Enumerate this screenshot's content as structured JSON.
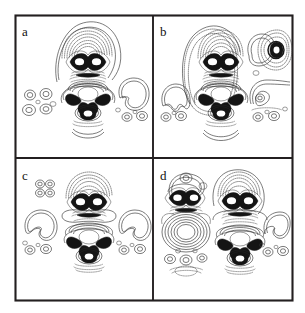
{
  "figure": {
    "name": "molecular-orbital-contour-figure",
    "background_color": "#ffffff",
    "border_color": "#231f20",
    "contour_solid_color": "#2a2a2a",
    "contour_dotted_color": "#3d3d3d",
    "lobe_fill_color": "#141414",
    "panel_rows": 2,
    "panel_columns": 2
  },
  "panels": [
    {
      "id": "panel-a",
      "label": "a",
      "row": 0,
      "column": 0,
      "features": [
        "central upper dark bowtie lobe with two white nodal holes",
        "dense dotted contour cap above the upper lobe",
        "central lower four-lobed butterfly with concentric rings",
        "solid arc below the lower lobe",
        "left cluster of four small ring pairs",
        "right kidney-shaped solid contour with small ring satellites"
      ]
    },
    {
      "id": "panel-b",
      "label": "b",
      "row": 0,
      "column": 1,
      "features": [
        "central upper dark bowtie lobe with two white nodal holes",
        "large dotted envelope surrounding the central column",
        "central lower four-lobed butterfly with concentric rings",
        "solid arc below the lower lobe",
        "left kidney-shaped solid contour with two small rings",
        "upper right dark blob with dotted concentric contours",
        "lower right kidney contour with ring satellites"
      ]
    },
    {
      "id": "panel-c",
      "label": "c",
      "row": 1,
      "column": 0,
      "features": [
        "upper left small four-ring cluster",
        "central upper dark bowtie lobe with dotted cap",
        "central lower four-lobed butterfly with dense contours",
        "left kidney-shaped solid contour with ring satellites",
        "right kidney-shaped solid contour with ring satellites"
      ]
    },
    {
      "id": "panel-d",
      "label": "d",
      "row": 1,
      "column": 1,
      "features": [
        "left dark bowtie lobe with dotted lasso contour above",
        "large left concentric oval ring stack of solid contours",
        "lower left dotted ring cluster",
        "central upper dark bowtie lobe with dotted cap",
        "central lower four-lobed butterfly with dense contours",
        "right kidney-shaped solid contour with ring satellites"
      ]
    }
  ]
}
